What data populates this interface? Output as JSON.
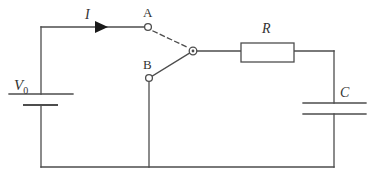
{
  "figure": {
    "type": "circuit-diagram",
    "width": 369,
    "height": 175,
    "background_color": "#ffffff",
    "line_color": "#4d4d4d",
    "text_color": "#333333"
  },
  "labels": {
    "source": "V",
    "source_subscript": "0",
    "current": "I",
    "contact_a": "A",
    "contact_b": "B",
    "resistor": "R",
    "capacitor": "C"
  },
  "components": {
    "battery": {
      "name": "V0",
      "kind": "dc-voltage-source",
      "x": 41,
      "long_plate": {
        "x1": 9,
        "x2": 73,
        "y": 94
      },
      "short_plate": {
        "x1": 24,
        "x2": 57,
        "y": 105
      }
    },
    "resistor": {
      "name": "R",
      "kind": "resistor-box",
      "x": 241,
      "y": 43,
      "width": 53,
      "height": 19
    },
    "capacitor": {
      "name": "C",
      "kind": "capacitor",
      "x": 334,
      "top_plate": {
        "x1": 303,
        "x2": 366,
        "y": 103
      },
      "bottom_plate": {
        "x1": 303,
        "x2": 366,
        "y": 114
      }
    },
    "switch": {
      "name": "two-position-switch",
      "pivot": {
        "x": 193,
        "y": 51
      },
      "contact_a": {
        "x": 148,
        "y": 27,
        "state": "open",
        "blade_style": "dashed"
      },
      "contact_b": {
        "x": 149,
        "y": 78,
        "state": "closed",
        "blade_style": "solid"
      }
    },
    "current_arrow": {
      "name": "I",
      "direction": "right",
      "tip_x": 108,
      "tail_x": 95,
      "y": 27
    }
  },
  "wires": [
    {
      "name": "top-left-wire",
      "x1": 41,
      "y1": 27,
      "x2": 148,
      "y2": 27
    },
    {
      "name": "battery-upper-lead",
      "x1": 41,
      "y1": 27,
      "x2": 41,
      "y2": 94
    },
    {
      "name": "battery-lower-lead",
      "x1": 41,
      "y1": 105,
      "x2": 41,
      "y2": 167
    },
    {
      "name": "bottom-wire",
      "x1": 41,
      "y1": 167,
      "x2": 334,
      "y2": 167
    },
    {
      "name": "contact-b-down-wire",
      "x1": 149,
      "y1": 78,
      "x2": 149,
      "y2": 167
    },
    {
      "name": "pivot-to-resistor-wire",
      "x1": 193,
      "y1": 51,
      "x2": 241,
      "y2": 51
    },
    {
      "name": "resistor-to-right-wire",
      "x1": 294,
      "y1": 51,
      "x2": 334,
      "y2": 51
    },
    {
      "name": "right-upper-lead",
      "x1": 334,
      "y1": 51,
      "x2": 334,
      "y2": 103
    },
    {
      "name": "right-lower-lead",
      "x1": 334,
      "y1": 114,
      "x2": 334,
      "y2": 167
    }
  ]
}
